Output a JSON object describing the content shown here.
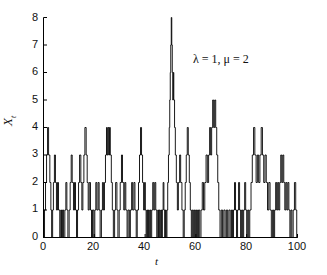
{
  "chart_data": {
    "type": "line",
    "step": "post",
    "title": "",
    "subtitle": "",
    "xlabel": "t",
    "ylabel": "X_t",
    "ylabel_display": "X",
    "ylabel_sub": "t",
    "xlim": [
      0,
      100
    ],
    "ylim": [
      0,
      8
    ],
    "xticks": [
      0,
      20,
      40,
      60,
      80,
      100
    ],
    "yticks": [
      0,
      1,
      2,
      3,
      4,
      5,
      6,
      7,
      8
    ],
    "xtick_labels": [
      "0",
      "20",
      "40",
      "60",
      "80",
      "100"
    ],
    "ytick_labels": [
      "0",
      "1",
      "2",
      "3",
      "4",
      "5",
      "6",
      "7",
      "8"
    ],
    "grid": false,
    "legend": null,
    "legend_position": "none",
    "line_color": "#000000",
    "line_width": 0.9,
    "annotations": [
      {
        "text": "λ = 1, μ = 2",
        "x": 62,
        "y": 6.55
      }
    ],
    "series": [
      {
        "name": "X_t",
        "description": "M/M/1 birth-death queue length sample path, lambda = 1, mu = 2",
        "x": [
          0,
          0.4,
          0.8,
          1.2,
          1.6,
          2.0,
          2.5,
          2.9,
          3.2,
          3.6,
          3.9,
          4.3,
          4.7,
          5.1,
          5.5,
          5.9,
          6.4,
          6.8,
          7.1,
          7.5,
          7.9,
          8.4,
          8.8,
          9.2,
          9.6,
          10.1,
          10.5,
          10.9,
          11.3,
          11.8,
          12.2,
          12.6,
          13.0,
          13.4,
          13.8,
          14.2,
          14.7,
          15.1,
          15.5,
          15.9,
          16.3,
          16.8,
          17.2,
          17.6,
          18.0,
          18.5,
          18.9,
          19.3,
          19.8,
          20.2,
          20.6,
          21.0,
          21.5,
          21.9,
          22.3,
          22.8,
          23.2,
          23.6,
          24.0,
          24.4,
          24.8,
          25.1,
          25.4,
          25.7,
          26.0,
          26.3,
          26.7,
          27.1,
          27.5,
          28.0,
          28.4,
          28.9,
          29.3,
          29.8,
          30.2,
          30.7,
          31.1,
          31.6,
          32.0,
          32.4,
          32.9,
          33.3,
          33.8,
          34.2,
          34.7,
          35.1,
          35.6,
          36.0,
          36.5,
          36.9,
          37.4,
          37.8,
          38.2,
          38.6,
          39.0,
          39.4,
          39.8,
          40.1,
          40.4,
          40.7,
          41.0,
          41.3,
          41.6,
          41.9,
          42.2,
          42.6,
          43.0,
          43.4,
          43.8,
          44.2,
          44.6,
          45.0,
          45.3,
          45.6,
          45.9,
          46.2,
          46.5,
          46.8,
          47.1,
          47.4,
          47.7,
          48.0,
          48.3,
          48.6,
          48.9,
          49.2,
          49.5,
          49.7,
          49.9,
          50.1,
          50.3,
          50.5,
          50.7,
          50.9,
          51.1,
          51.3,
          51.6,
          51.9,
          52.3,
          52.7,
          53.1,
          53.6,
          54.0,
          54.5,
          55.0,
          55.4,
          55.8,
          56.2,
          56.6,
          57.0,
          57.4,
          57.8,
          58.2,
          58.6,
          59.0,
          59.4,
          59.8,
          60.2,
          60.6,
          61.0,
          61.5,
          62.0,
          62.5,
          63.0,
          63.5,
          64.0,
          64.5,
          65.0,
          65.4,
          65.8,
          66.2,
          66.6,
          67.0,
          67.4,
          67.8,
          68.2,
          68.6,
          69.0,
          69.5,
          70.0,
          70.5,
          71.0,
          71.5,
          72.0,
          72.5,
          73.0,
          73.5,
          74.0,
          74.4,
          74.8,
          75.2,
          75.6,
          76.0,
          76.4,
          76.8,
          77.2,
          77.6,
          78.0,
          78.4,
          78.8,
          79.2,
          79.6,
          80.0,
          80.4,
          80.8,
          81.2,
          81.7,
          82.2,
          82.7,
          83.2,
          83.7,
          84.2,
          84.7,
          85.2,
          85.7,
          86.2,
          86.7,
          87.2,
          87.7,
          88.2,
          88.7,
          89.2,
          89.7,
          90.2,
          90.6,
          91.0,
          91.4,
          91.8,
          92.2,
          92.6,
          93.0,
          93.4,
          93.8,
          94.2,
          94.6,
          95.0,
          95.4,
          95.8,
          96.2,
          96.6,
          97.0,
          97.4,
          97.8,
          98.3,
          98.8,
          99.3,
          99.7,
          100
        ],
        "y": [
          0,
          1,
          2,
          3,
          4,
          3,
          2,
          1,
          0,
          1,
          2,
          3,
          2,
          1,
          2,
          1,
          0,
          1,
          0,
          1,
          0,
          1,
          2,
          1,
          0,
          1,
          2,
          3,
          2,
          1,
          2,
          1,
          0,
          1,
          2,
          3,
          2,
          1,
          2,
          3,
          4,
          3,
          2,
          1,
          2,
          1,
          0,
          1,
          0,
          1,
          2,
          1,
          2,
          1,
          0,
          1,
          2,
          1,
          2,
          3,
          4,
          3,
          4,
          3,
          4,
          3,
          2,
          1,
          0,
          1,
          2,
          1,
          0,
          1,
          2,
          3,
          2,
          1,
          2,
          1,
          0,
          1,
          0,
          1,
          2,
          1,
          2,
          1,
          0,
          1,
          2,
          3,
          4,
          3,
          2,
          1,
          2,
          1,
          0,
          1,
          0,
          1,
          0,
          1,
          0,
          1,
          2,
          1,
          2,
          1,
          0,
          1,
          0,
          1,
          0,
          1,
          0,
          1,
          2,
          1,
          0,
          1,
          0,
          1,
          2,
          3,
          4,
          5,
          6,
          7,
          8,
          7,
          6,
          5,
          6,
          5,
          4,
          3,
          2,
          1,
          2,
          3,
          2,
          1,
          0,
          1,
          2,
          3,
          4,
          3,
          2,
          1,
          0,
          1,
          0,
          1,
          0,
          1,
          0,
          1,
          0,
          1,
          2,
          1,
          2,
          3,
          2,
          3,
          4,
          3,
          4,
          5,
          4,
          5,
          4,
          3,
          2,
          1,
          0,
          1,
          0,
          1,
          0,
          1,
          0,
          1,
          0,
          1,
          0,
          1,
          2,
          1,
          0,
          1,
          2,
          1,
          0,
          1,
          0,
          1,
          2,
          1,
          0,
          1,
          0,
          1,
          2,
          3,
          4,
          3,
          2,
          3,
          2,
          3,
          4,
          3,
          2,
          3,
          2,
          1,
          2,
          1,
          0,
          1,
          0,
          1,
          2,
          1,
          2,
          1,
          2,
          3,
          2,
          3,
          2,
          1,
          2,
          1,
          2,
          1,
          0,
          1,
          0,
          1,
          2,
          1,
          0,
          0
        ]
      }
    ]
  },
  "axis": {
    "x_axis_name": "t",
    "y_axis_name": "Xt"
  }
}
